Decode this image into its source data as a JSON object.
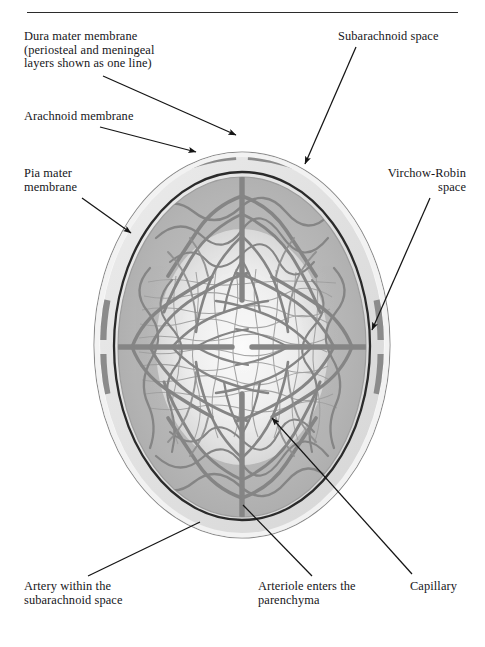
{
  "figure": {
    "title_rule": true
  },
  "labels": [
    {
      "id": "dura-mater",
      "text": "Dura mater membrane\n(periosteal and meningeal\nlayers shown as one line)",
      "align": "left",
      "x": 24,
      "y": 30,
      "w": 200,
      "leader": {
        "x1": 103,
        "y1": 76,
        "x2": 236,
        "y2": 135
      }
    },
    {
      "id": "arachnoid",
      "text": "Arachnoid membrane",
      "align": "left",
      "x": 24,
      "y": 110,
      "w": 180,
      "leader": {
        "x1": 100,
        "y1": 127,
        "x2": 196,
        "y2": 152
      }
    },
    {
      "id": "pia-mater",
      "text": "Pia mater\nmembrane",
      "align": "left",
      "x": 24,
      "y": 167,
      "w": 120,
      "leader": {
        "x1": 82,
        "y1": 198,
        "x2": 131,
        "y2": 233
      }
    },
    {
      "id": "subarachnoid-space",
      "text": "Subarachnoid space",
      "align": "left",
      "x": 338,
      "y": 30,
      "w": 140,
      "leader": {
        "x1": 356,
        "y1": 47,
        "x2": 305,
        "y2": 164
      }
    },
    {
      "id": "virchow-robin",
      "text": "Virchow-Robin\nspace",
      "align": "right",
      "x": 338,
      "y": 167,
      "w": 128,
      "leader": {
        "x1": 430,
        "y1": 198,
        "x2": 372,
        "y2": 330
      }
    },
    {
      "id": "artery-subarachnoid",
      "text": "Artery within the\nsubarachnoid space",
      "align": "left",
      "x": 24,
      "y": 580,
      "w": 160,
      "leader": {
        "x1": 88,
        "y1": 576,
        "x2": 200,
        "y2": 522
      }
    },
    {
      "id": "arteriole-parenchyma",
      "text": "Arteriole enters the\nparenchyma",
      "align": "left",
      "x": 258,
      "y": 580,
      "w": 160,
      "leader": {
        "x1": 312,
        "y1": 576,
        "x2": 243,
        "y2": 505
      }
    },
    {
      "id": "capillary",
      "text": "Capillary",
      "align": "left",
      "x": 410,
      "y": 580,
      "w": 70,
      "leader": {
        "x1": 412,
        "y1": 574,
        "x2": 272,
        "y2": 418
      }
    }
  ],
  "anatomy": {
    "layers": [
      {
        "name": "dura-mater-membrane",
        "kind": "outline",
        "color": "#767676"
      },
      {
        "name": "subarachnoid-space",
        "kind": "band",
        "color": "#e2e2e2"
      },
      {
        "name": "arachnoid-membrane",
        "kind": "line",
        "color": "#2e2e2e"
      },
      {
        "name": "pia-mater-membrane",
        "kind": "line",
        "color": "#9a9a9a"
      },
      {
        "name": "brain-parenchyma",
        "kind": "fill",
        "color": "#b6b6b6"
      },
      {
        "name": "parenchyma-core",
        "kind": "fill",
        "color": "#f2f2f2"
      }
    ],
    "vessels": {
      "artery_color": "#8b8b8b",
      "arteriole_color": "#949494",
      "capillary_color": "#a5a5a5",
      "artery_count": 4,
      "artery_positions": [
        "superior",
        "inferior",
        "left-lateral",
        "right-lateral"
      ]
    },
    "oval": {
      "cx": 242,
      "cy": 345,
      "rx": 148,
      "ry": 193
    }
  },
  "colors": {
    "ink": "#16161a",
    "rule": "#2b2b2b",
    "paper": "#ffffff",
    "dura": "#767676",
    "subarachnoid": "#e2e2e2",
    "arachnoid": "#2e2e2e",
    "parenchyma": "#b6b6b6",
    "vessel": "#8b8b8b"
  }
}
